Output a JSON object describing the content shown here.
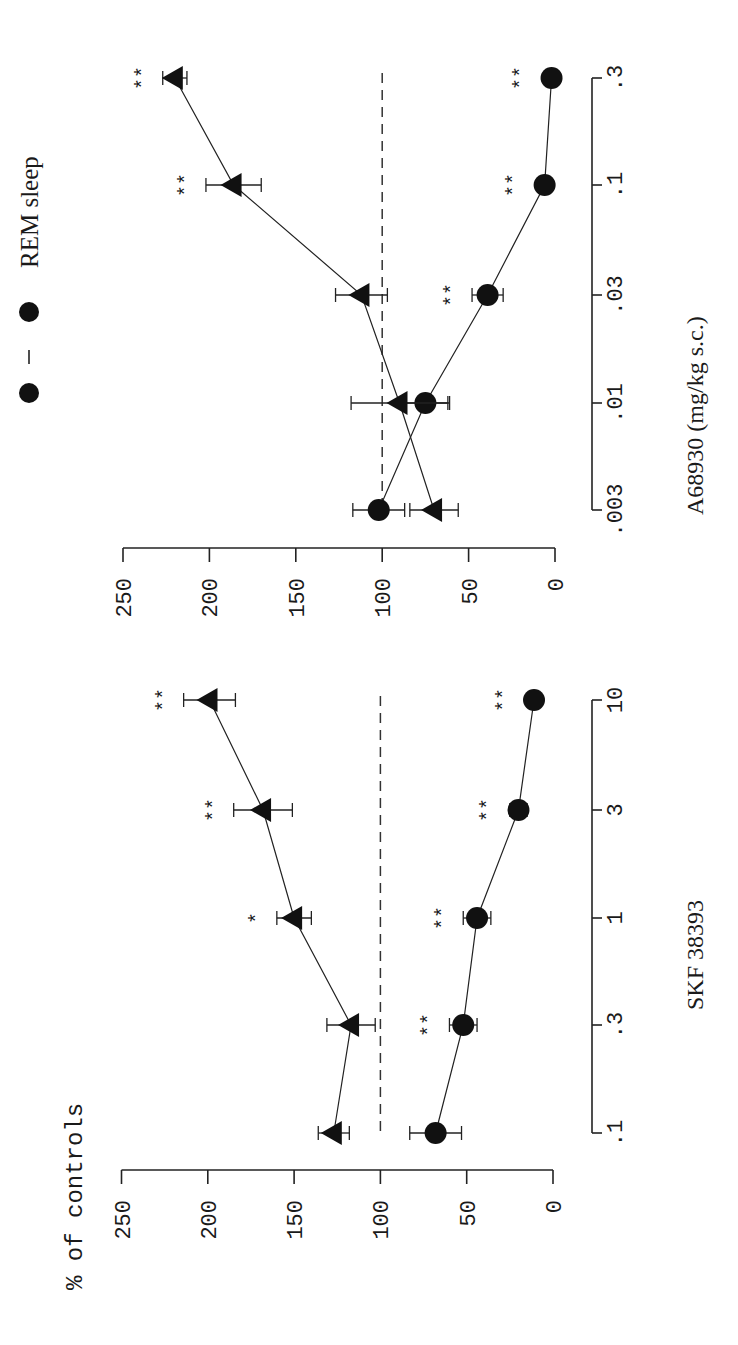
{
  "figure": {
    "legend": {
      "label": "REM sleep",
      "marker": "filled-circle"
    },
    "y_axis_title": "% of controls"
  },
  "chart_data": [
    {
      "type": "line",
      "panel": "top (rotated figure, right panel)",
      "title": "",
      "xlabel": "A68930 (mg/kg s.c.)",
      "ylabel": "% of controls",
      "x": [
        ".003",
        ".01",
        ".03",
        ".1",
        ".3"
      ],
      "x_scale": "log",
      "ylim": [
        0,
        250
      ],
      "yticks": [
        0,
        50,
        100,
        150,
        200,
        250
      ],
      "reference_line": {
        "y": 100,
        "style": "dashed"
      },
      "grid": false,
      "series": [
        {
          "name": "REM sleep",
          "marker": "circle",
          "values": [
            102,
            75,
            39,
            6,
            2
          ],
          "errors": [
            15,
            14,
            9,
            0,
            0
          ],
          "significance": [
            "",
            "",
            "**",
            "**",
            "**"
          ]
        },
        {
          "name": "triangle series",
          "marker": "triangle",
          "values": [
            70,
            90,
            112,
            186,
            220
          ],
          "errors": [
            14,
            28,
            15,
            16,
            7
          ],
          "significance": [
            "",
            "",
            "",
            "**",
            "**"
          ]
        }
      ]
    },
    {
      "type": "line",
      "panel": "bottom (rotated figure, left panel)",
      "title": "",
      "xlabel": "SKF 38393",
      "ylabel": "% of controls",
      "x": [
        ".1",
        ".3",
        "1",
        "3",
        "10"
      ],
      "x_scale": "log",
      "ylim": [
        0,
        250
      ],
      "yticks": [
        0,
        50,
        100,
        150,
        200,
        250
      ],
      "reference_line": {
        "y": 100,
        "style": "dashed"
      },
      "grid": false,
      "series": [
        {
          "name": "REM sleep",
          "marker": "circle",
          "values": [
            68,
            52,
            44,
            20,
            11
          ],
          "errors": [
            15,
            8,
            8,
            5,
            0
          ],
          "significance": [
            "",
            "**",
            "**",
            "**",
            "**"
          ]
        },
        {
          "name": "triangle series",
          "marker": "triangle",
          "values": [
            127,
            117,
            150,
            168,
            199
          ],
          "errors": [
            9,
            14,
            10,
            17,
            15
          ],
          "significance": [
            "",
            "",
            "*",
            "**",
            "**"
          ]
        }
      ]
    }
  ],
  "layout": {
    "rotation_deg": -90,
    "panels": [
      {
        "value_zero_x": 555,
        "px_per_unit": 1.728,
        "value_axis_y": 548,
        "dose_axis_x": 592,
        "dose_y": [
          510,
          403,
          295,
          185,
          78
        ],
        "ref_y_range": [
          73,
          510
        ]
      },
      {
        "value_zero_x": 553,
        "px_per_unit": 1.726,
        "value_axis_y": 1170,
        "dose_axis_x": 592,
        "dose_y": [
          1133,
          1025,
          918,
          810,
          700
        ],
        "ref_y_range": [
          696,
          1133
        ]
      }
    ]
  }
}
